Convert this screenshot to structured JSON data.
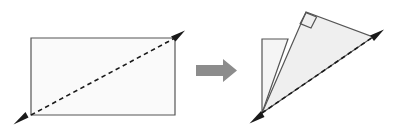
{
  "figure": {
    "canvas": {
      "width": 399,
      "height": 133,
      "background": "#ffffff"
    },
    "style": {
      "outline_color": "#555555",
      "outline_width": 1.2,
      "rect_fill": "#fafafa",
      "triangle_fill": "#efefef",
      "flap_fill": "#f5f5f5",
      "dash_color": "#1a1a1a",
      "dash_width": 1.6,
      "dash_pattern": "4.5,3.5",
      "arrowhead_color": "#1a1a1a",
      "block_arrow_fill": "#8c8c8c"
    },
    "left_panel": {
      "name": "original-rectangle",
      "rectangle": {
        "x": 31,
        "y": 38,
        "width": 144,
        "height": 77,
        "points": "31,38 175,38 175,115 31,115"
      },
      "diagonal": {
        "name": "rectangle-diagonal",
        "from": {
          "x": 31,
          "y": 115
        },
        "to": {
          "x": 175,
          "y": 38
        },
        "arrow_start": {
          "x": 14,
          "y": 124
        },
        "arrow_end": {
          "x": 184,
          "y": 31
        },
        "double_headed": true
      }
    },
    "transform_arrow": {
      "name": "transform-block-arrow",
      "direction": "right",
      "shaft": {
        "x": 196,
        "y": 65,
        "width": 27,
        "height": 11
      },
      "head": {
        "tip_x": 237,
        "top_y": 59,
        "bottom_y": 82,
        "base_x": 223
      },
      "points": "196,65 223,65 223,59 237,70.5 223,82 223,76 196,76"
    },
    "right_panel": {
      "name": "folded-right-triangle",
      "triangle": {
        "name": "main-right-triangle",
        "points": "262,113 306,12 373,37",
        "vertices": [
          {
            "label": "bottom",
            "x": 262,
            "y": 113
          },
          {
            "label": "apex",
            "x": 306,
            "y": 12
          },
          {
            "label": "right",
            "x": 373,
            "y": 37
          }
        ]
      },
      "flap": {
        "name": "folded-flap-quad",
        "points": "262,39 288,39 262,113",
        "rect_edge": {
          "x": 262,
          "y": 39,
          "width": 26,
          "height": 74
        }
      },
      "right_angle_marker": {
        "name": "right-angle-marker",
        "points": "297,25 306,12 318,21 309,34",
        "at_vertex": "apex"
      },
      "diagonal": {
        "name": "triangle-hypotenuse-dashed",
        "from": {
          "x": 262,
          "y": 113
        },
        "to": {
          "x": 373,
          "y": 37
        },
        "arrow_start": {
          "x": 250,
          "y": 123
        },
        "arrow_end": {
          "x": 384,
          "y": 30
        },
        "double_headed": true
      }
    }
  }
}
